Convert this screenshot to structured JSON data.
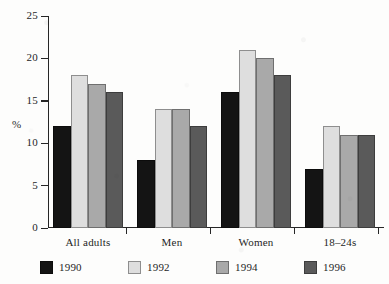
{
  "chart_data": {
    "type": "bar",
    "title": "",
    "xlabel": "",
    "ylabel": "%",
    "ylim": [
      0,
      25
    ],
    "yticks": [
      0,
      5,
      10,
      15,
      20,
      25
    ],
    "grid": false,
    "legend_position": "bottom",
    "categories": [
      "All adults",
      "Men",
      "Women",
      "18–24s"
    ],
    "series": [
      {
        "name": "1990",
        "color": "#141414",
        "values": [
          12,
          8,
          16,
          7
        ]
      },
      {
        "name": "1992",
        "color": "#dedede",
        "values": [
          18,
          14,
          21,
          12
        ]
      },
      {
        "name": "1994",
        "color": "#a9a9a9",
        "values": [
          17,
          14,
          20,
          11
        ]
      },
      {
        "name": "1996",
        "color": "#5a5a5a",
        "values": [
          16,
          12,
          18,
          11
        ]
      }
    ]
  },
  "axis": {
    "y_label": "%",
    "y_tick_labels": [
      "0",
      "5",
      "10",
      "15",
      "20",
      "25"
    ]
  },
  "legend": {
    "entries": [
      {
        "label": "1990"
      },
      {
        "label": "1992"
      },
      {
        "label": "1994"
      },
      {
        "label": "1996"
      }
    ]
  }
}
